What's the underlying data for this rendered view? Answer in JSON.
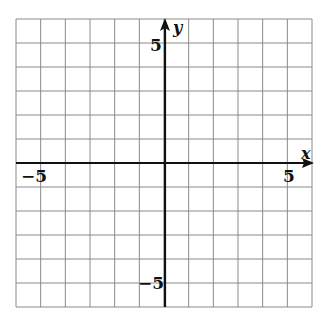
{
  "chart_data": {
    "type": "coordinate-grid",
    "title": "",
    "xlabel": "x",
    "ylabel": "y",
    "xlim": [
      -6,
      6
    ],
    "ylim": [
      -6,
      6
    ],
    "grid": true,
    "grid_step": 1,
    "tick_labels": {
      "x": [
        {
          "value": -5,
          "label": "−5"
        },
        {
          "value": 5,
          "label": "5"
        }
      ],
      "y": [
        {
          "value": 5,
          "label": "5"
        },
        {
          "value": -5,
          "label": "−5"
        }
      ]
    },
    "series": []
  },
  "colors": {
    "grid": "#8a8a8a",
    "axis": "#111111",
    "background": "#ffffff"
  },
  "labels": {
    "x_axis": "x",
    "y_axis": "y",
    "x_neg5": "−5",
    "x_pos5": "5",
    "y_pos5": "5",
    "y_neg5": "−5"
  }
}
